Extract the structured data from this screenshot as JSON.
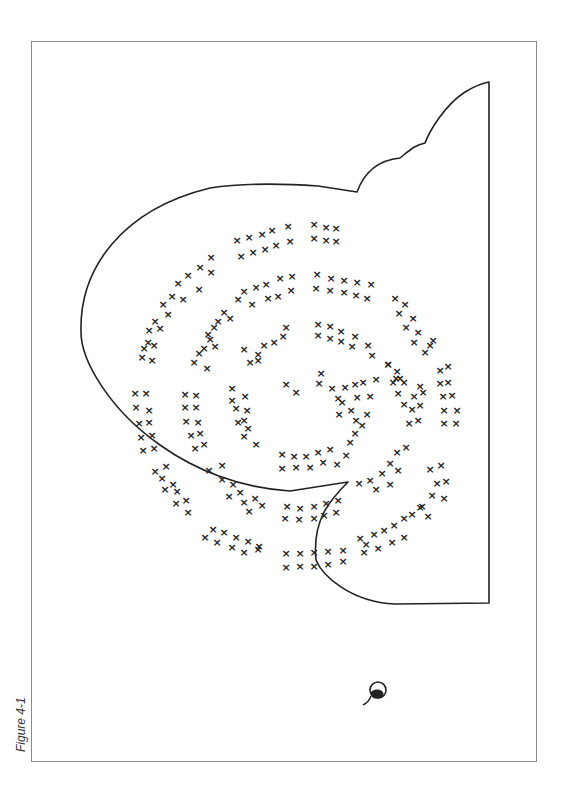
{
  "figure": {
    "caption": "Figure 4-1",
    "mark_symbol": "×",
    "line_color": "#222222",
    "frame_color": "#8a8a8a"
  }
}
